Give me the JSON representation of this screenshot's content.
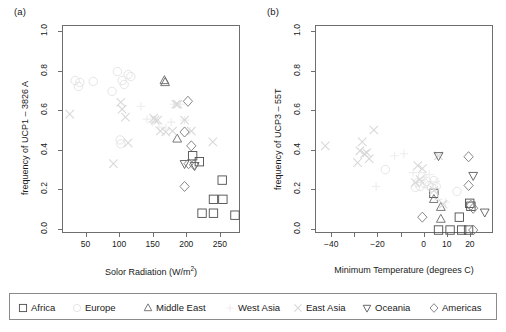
{
  "figure": {
    "panel_a_tag": "(a)",
    "panel_b_tag": "(b)"
  },
  "legend": {
    "entries": [
      {
        "label": "Africa",
        "symbol": "square",
        "color": "#4d4d4d"
      },
      {
        "label": "Europe",
        "symbol": "circle",
        "color": "#e2e2e2"
      },
      {
        "label": "Middle East",
        "symbol": "triangle-up",
        "color": "#6a6a6a"
      },
      {
        "label": "West Asia",
        "symbol": "plus",
        "color": "#ededed"
      },
      {
        "label": "East Asia",
        "symbol": "cross",
        "color": "#d8d8d8"
      },
      {
        "label": "Oceania",
        "symbol": "triangle-down",
        "color": "#5a5a5a"
      },
      {
        "label": "Americas",
        "symbol": "diamond",
        "color": "#7a7a7a"
      }
    ]
  },
  "chart_data": [
    {
      "id": "panel-a",
      "type": "scatter",
      "title": "(a)",
      "xlabel": "Solor Radiation (W/m2)",
      "xlabel_display": "Solor Radiation (W/m",
      "xlabel_sup": "2",
      "xlabel_tail": ")",
      "ylabel": "frequency of UCP1 – 3826 A",
      "xlim": [
        15,
        280
      ],
      "ylim": [
        -0.02,
        1.03
      ],
      "xticks": [
        50,
        100,
        150,
        200,
        250
      ],
      "xtick_labels": [
        "50",
        "100",
        "150",
        "200",
        "250"
      ],
      "yticks": [
        0.0,
        0.2,
        0.4,
        0.6,
        0.8,
        1.0
      ],
      "ytick_labels": [
        "0.0",
        "0.2",
        "0.4",
        "0.6",
        "0.8",
        "1.0"
      ],
      "grid": false,
      "legend_position": "below-figure",
      "series": [
        {
          "name": "Africa",
          "symbol": "square",
          "color": "#4d4d4d",
          "points": [
            [
              208,
              0.375
            ],
            [
              222,
              0.085
            ],
            [
              239,
              0.085
            ],
            [
              239,
              0.155
            ],
            [
              253,
              0.155
            ],
            [
              252,
              0.252
            ],
            [
              271,
              0.075
            ],
            [
              218,
              0.345
            ]
          ]
        },
        {
          "name": "Europe",
          "symbol": "circle",
          "color": "#e2e2e2",
          "points": [
            [
              33,
              0.755
            ],
            [
              38,
              0.725
            ],
            [
              40,
              0.745
            ],
            [
              96,
              0.8
            ],
            [
              103,
              0.755
            ],
            [
              106,
              0.735
            ],
            [
              112,
              0.785
            ],
            [
              116,
              0.775
            ],
            [
              100,
              0.455
            ],
            [
              101,
              0.435
            ],
            [
              60,
              0.75
            ],
            [
              88,
              0.7
            ]
          ]
        },
        {
          "name": "Middle East",
          "symbol": "triangle-up",
          "color": "#6a6a6a",
          "points": [
            [
              166,
              0.755
            ],
            [
              167,
              0.745
            ],
            [
              185,
              0.46
            ]
          ]
        },
        {
          "name": "West Asia",
          "symbol": "plus",
          "color": "#ededed",
          "points": [
            [
              131,
              0.625
            ],
            [
              140,
              0.56
            ],
            [
              148,
              0.545
            ],
            [
              158,
              0.52
            ],
            [
              168,
              0.515
            ],
            [
              176,
              0.545
            ],
            [
              180,
              0.635
            ],
            [
              190,
              0.635
            ],
            [
              196,
              0.555
            ],
            [
              204,
              0.5
            ]
          ]
        },
        {
          "name": "East Asia",
          "symbol": "cross",
          "color": "#d8d8d8",
          "points": [
            [
              25,
              0.585
            ],
            [
              90,
              0.335
            ],
            [
              101,
              0.645
            ],
            [
              103,
              0.61
            ],
            [
              108,
              0.57
            ],
            [
              112,
              0.44
            ],
            [
              150,
              0.565
            ],
            [
              152,
              0.555
            ],
            [
              156,
              0.555
            ],
            [
              160,
              0.5
            ],
            [
              168,
              0.495
            ],
            [
              178,
              0.5
            ],
            [
              186,
              0.635
            ],
            [
              196,
              0.555
            ],
            [
              206,
              0.5
            ],
            [
              238,
              0.445
            ],
            [
              183,
              0.635
            ]
          ]
        },
        {
          "name": "Oceania",
          "symbol": "triangle-down",
          "color": "#5a5a5a",
          "points": [
            [
              196,
              0.335
            ],
            [
              211,
              0.325
            ]
          ]
        },
        {
          "name": "Americas",
          "symbol": "diamond",
          "color": "#7a7a7a",
          "points": [
            [
              201,
              0.65
            ],
            [
              196,
              0.495
            ],
            [
              206,
              0.425
            ],
            [
              202,
              0.335
            ],
            [
              196,
              0.22
            ],
            [
              210,
              0.33
            ]
          ]
        }
      ]
    },
    {
      "id": "panel-b",
      "type": "scatter",
      "title": "(b)",
      "xlabel": "Minimum Temperature (degrees C)",
      "ylabel": "frequency of UCP3 – 55T",
      "xlim": [
        -47,
        30
      ],
      "ylim": [
        -0.02,
        1.03
      ],
      "xticks": [
        -40,
        -30,
        -20,
        -10,
        0,
        10,
        20
      ],
      "xtick_labels": [
        "-40",
        "",
        "-20",
        "",
        "0",
        "10",
        "20"
      ],
      "yticks": [
        0.0,
        0.2,
        0.4,
        0.6,
        0.8,
        1.0
      ],
      "ytick_labels": [
        "0.0",
        "0.2",
        "0.4",
        "0.6",
        "0.8",
        "1.0"
      ],
      "grid": false,
      "legend_position": "below-figure",
      "series": [
        {
          "name": "Africa",
          "symbol": "square",
          "color": "#4d4d4d",
          "points": [
            [
              4,
              0.185
            ],
            [
              6,
              0.0
            ],
            [
              11,
              0.0
            ],
            [
              15,
              0.065
            ],
            [
              16,
              0.0
            ],
            [
              19,
              0.0
            ],
            [
              19.5,
              0.135
            ],
            [
              20,
              0.12
            ]
          ]
        },
        {
          "name": "Europe",
          "symbol": "circle",
          "color": "#e2e2e2",
          "points": [
            [
              -17,
              0.305
            ],
            [
              -4,
              0.215
            ],
            [
              -2,
              0.22
            ],
            [
              0,
              0.235
            ],
            [
              1,
              0.245
            ],
            [
              2,
              0.225
            ],
            [
              3,
              0.215
            ],
            [
              4,
              0.25
            ],
            [
              5,
              0.22
            ],
            [
              14,
              0.195
            ],
            [
              -1,
              0.27
            ],
            [
              -3,
              0.24
            ]
          ]
        },
        {
          "name": "Middle East",
          "symbol": "triangle-up",
          "color": "#6a6a6a",
          "points": [
            [
              4,
              0.155
            ],
            [
              7,
              0.115
            ],
            [
              7,
              0.055
            ]
          ]
        },
        {
          "name": "West Asia",
          "symbol": "plus",
          "color": "#ededed",
          "points": [
            [
              -21,
              0.22
            ],
            [
              -13,
              0.375
            ],
            [
              -9,
              0.385
            ],
            [
              -5,
              0.29
            ],
            [
              0,
              0.265
            ],
            [
              2,
              0.28
            ],
            [
              5,
              0.245
            ],
            [
              6,
              0.155
            ],
            [
              9,
              0.14
            ]
          ]
        },
        {
          "name": "East Asia",
          "symbol": "cross",
          "color": "#d8d8d8",
          "points": [
            [
              -43,
              0.425
            ],
            [
              -29,
              0.34
            ],
            [
              -28,
              0.4
            ],
            [
              -27,
              0.445
            ],
            [
              -26,
              0.385
            ],
            [
              -25,
              0.39
            ],
            [
              -24,
              0.36
            ],
            [
              -22,
              0.505
            ],
            [
              -3,
              0.325
            ],
            [
              -1,
              0.31
            ],
            [
              -2,
              0.255
            ],
            [
              -4,
              0.24
            ],
            [
              4,
              0.2
            ],
            [
              6,
              0.375
            ],
            [
              8,
              0.13
            ]
          ]
        },
        {
          "name": "Oceania",
          "symbol": "triangle-down",
          "color": "#5a5a5a",
          "points": [
            [
              21,
              0.275
            ],
            [
              26,
              0.09
            ],
            [
              6,
              0.375
            ]
          ]
        },
        {
          "name": "Americas",
          "symbol": "diamond",
          "color": "#7a7a7a",
          "points": [
            [
              -1,
              0.065
            ],
            [
              19,
              0.37
            ],
            [
              19,
              0.225
            ],
            [
              21,
              0.11
            ],
            [
              21,
              0.0
            ],
            [
              20,
              0.125
            ]
          ]
        }
      ]
    }
  ]
}
